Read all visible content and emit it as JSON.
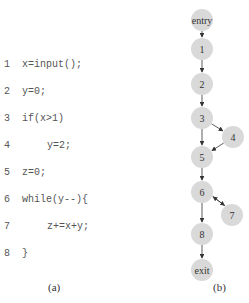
{
  "code": {
    "lines": [
      {
        "num": "1",
        "text": "x=input();",
        "indent": 0
      },
      {
        "num": "2",
        "text": "y=0;",
        "indent": 0
      },
      {
        "num": "3",
        "text": "if(x>1)",
        "indent": 0
      },
      {
        "num": "4",
        "text": "y=2;",
        "indent": 1
      },
      {
        "num": "5",
        "text": "z=0;",
        "indent": 0
      },
      {
        "num": "6",
        "text": "while(y--){",
        "indent": 0
      },
      {
        "num": "7",
        "text": "z+=x+y;",
        "indent": 1
      },
      {
        "num": "8",
        "text": "}",
        "indent": 0
      }
    ],
    "caption": "(a)"
  },
  "graph": {
    "caption": "(b)",
    "node_fill": "#d9d9d9",
    "edge_color": "#333333",
    "nodes": [
      {
        "id": "entry",
        "label": "entry",
        "x": 202,
        "y": 20
      },
      {
        "id": "1",
        "label": "1",
        "x": 202,
        "y": 49
      },
      {
        "id": "2",
        "label": "2",
        "x": 202,
        "y": 84
      },
      {
        "id": "3",
        "label": "3",
        "x": 202,
        "y": 118
      },
      {
        "id": "4",
        "label": "4",
        "x": 233,
        "y": 137
      },
      {
        "id": "5",
        "label": "5",
        "x": 202,
        "y": 157
      },
      {
        "id": "6",
        "label": "6",
        "x": 202,
        "y": 192
      },
      {
        "id": "7",
        "label": "7",
        "x": 232,
        "y": 215
      },
      {
        "id": "8",
        "label": "8",
        "x": 202,
        "y": 234
      },
      {
        "id": "exit",
        "label": "exit",
        "x": 202,
        "y": 270
      }
    ],
    "edges": [
      {
        "from": "entry",
        "to": "1"
      },
      {
        "from": "1",
        "to": "2"
      },
      {
        "from": "2",
        "to": "3"
      },
      {
        "from": "3",
        "to": "4"
      },
      {
        "from": "3",
        "to": "5"
      },
      {
        "from": "4",
        "to": "5"
      },
      {
        "from": "5",
        "to": "6"
      },
      {
        "from": "6",
        "to": "7"
      },
      {
        "from": "7",
        "to": "6"
      },
      {
        "from": "6",
        "to": "8"
      },
      {
        "from": "8",
        "to": "exit"
      }
    ]
  }
}
